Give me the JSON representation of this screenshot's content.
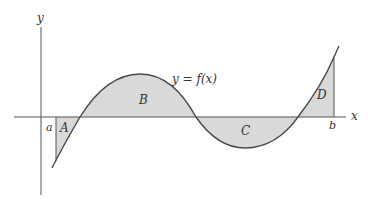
{
  "diagram": {
    "axes": {
      "x_label": "x",
      "y_label": "y"
    },
    "curve_label": "y = f(x)",
    "bounds": {
      "left": "a",
      "right": "b"
    },
    "regions": [
      {
        "label": "A",
        "position": "below x-axis",
        "sign": "negative"
      },
      {
        "label": "B",
        "position": "above x-axis",
        "sign": "positive"
      },
      {
        "label": "C",
        "position": "below x-axis",
        "sign": "negative"
      },
      {
        "label": "D",
        "position": "above x-axis",
        "sign": "positive"
      }
    ],
    "colors": {
      "fill": "#d9d9d9",
      "stroke": "#4a4a4a",
      "axis": "#555555"
    }
  }
}
